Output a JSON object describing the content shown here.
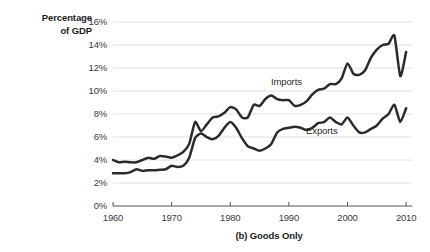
{
  "chart_data": {
    "type": "line",
    "title": "",
    "caption": "(b) Goods Only",
    "ylabel_line1": "Percentage",
    "ylabel_line2": "of GDP",
    "xlabel": "",
    "xlim": [
      1960,
      2011
    ],
    "ylim": [
      0,
      16
    ],
    "grid": true,
    "legend_position": "inline-annotation",
    "y_ticks": [
      "0%",
      "2%",
      "4%",
      "6%",
      "8%",
      "10%",
      "12%",
      "14%",
      "16%"
    ],
    "y_tick_values": [
      0,
      2,
      4,
      6,
      8,
      10,
      12,
      14,
      16
    ],
    "x_ticks": [
      "1960",
      "1970",
      "1980",
      "1990",
      "2000",
      "2010"
    ],
    "x_tick_values": [
      1960,
      1970,
      1980,
      1990,
      2000,
      2010
    ],
    "x": [
      1960,
      1961,
      1962,
      1963,
      1964,
      1965,
      1966,
      1967,
      1968,
      1969,
      1970,
      1971,
      1972,
      1973,
      1974,
      1975,
      1976,
      1977,
      1978,
      1979,
      1980,
      1981,
      1982,
      1983,
      1984,
      1985,
      1986,
      1987,
      1988,
      1989,
      1990,
      1991,
      1992,
      1993,
      1994,
      1995,
      1996,
      1997,
      1998,
      1999,
      2000,
      2001,
      2002,
      2003,
      2004,
      2005,
      2006,
      2007,
      2008,
      2009,
      2010
    ],
    "series": [
      {
        "name": "Imports",
        "color": "#2b2b2b",
        "values": [
          4.0,
          3.8,
          3.85,
          3.8,
          3.8,
          4.0,
          4.2,
          4.1,
          4.35,
          4.3,
          4.2,
          4.4,
          4.7,
          5.4,
          7.3,
          6.5,
          7.1,
          7.7,
          7.8,
          8.1,
          8.6,
          8.4,
          7.7,
          7.7,
          8.8,
          8.7,
          9.3,
          9.6,
          9.3,
          9.2,
          9.2,
          8.7,
          8.8,
          9.1,
          9.7,
          10.1,
          10.2,
          10.6,
          10.6,
          11.1,
          12.4,
          11.5,
          11.4,
          11.8,
          12.9,
          13.6,
          14.0,
          14.1,
          14.8,
          11.3,
          13.4
        ]
      },
      {
        "name": "Exports",
        "color": "#2b2b2b",
        "values": [
          2.85,
          2.85,
          2.85,
          2.95,
          3.2,
          3.05,
          3.1,
          3.1,
          3.15,
          3.2,
          3.5,
          3.4,
          3.5,
          4.2,
          5.9,
          6.3,
          6.0,
          5.8,
          6.1,
          6.8,
          7.3,
          6.8,
          5.9,
          5.2,
          5.0,
          4.8,
          5.0,
          5.4,
          6.4,
          6.7,
          6.8,
          6.9,
          6.8,
          6.6,
          6.8,
          7.2,
          7.3,
          7.7,
          7.3,
          7.1,
          7.7,
          7.0,
          6.4,
          6.4,
          6.7,
          7.0,
          7.6,
          8.0,
          8.8,
          7.3,
          8.5
        ]
      }
    ],
    "annotations": [
      {
        "text": "Imports",
        "x_value": 1990,
        "y_value": 10.7
      },
      {
        "text": "Exports",
        "x_value": 1996,
        "y_value": 6.4
      }
    ]
  }
}
